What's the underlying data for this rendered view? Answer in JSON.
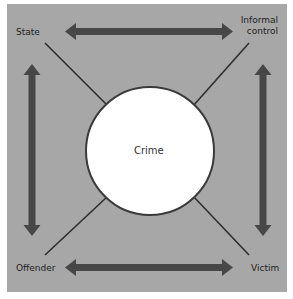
{
  "diagram": {
    "center": {
      "label": "Crime"
    },
    "nodes": {
      "state": "State",
      "informal_control_line1": "Informal",
      "informal_control_line2": "control",
      "offender": "Offender",
      "victim": "Victim"
    },
    "connections": [
      {
        "from": "State",
        "to": "Informal control",
        "type": "double-arrow"
      },
      {
        "from": "Offender",
        "to": "Victim",
        "type": "double-arrow"
      },
      {
        "from": "State",
        "to": "Offender",
        "type": "double-arrow"
      },
      {
        "from": "Informal control",
        "to": "Victim",
        "type": "double-arrow"
      },
      {
        "from": "State",
        "to": "Crime",
        "type": "line"
      },
      {
        "from": "Informal control",
        "to": "Crime",
        "type": "line"
      },
      {
        "from": "Offender",
        "to": "Crime",
        "type": "line"
      },
      {
        "from": "Victim",
        "to": "Crime",
        "type": "line"
      }
    ],
    "colors": {
      "background": "#a7a7a7",
      "arrow": "#474747",
      "circle_fill": "#ffffff",
      "circle_stroke": "#3a3a3a"
    }
  }
}
